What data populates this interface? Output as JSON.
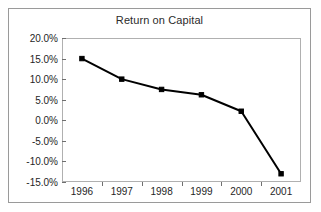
{
  "chart_data": {
    "type": "line",
    "title": "Return on Capital",
    "xlabel": "",
    "ylabel": "",
    "categories": [
      "1996",
      "1997",
      "1998",
      "1999",
      "2000",
      "2001"
    ],
    "values": [
      0.15,
      0.1,
      0.075,
      0.062,
      0.022,
      -0.13
    ],
    "value_labels": [
      "15.0%",
      "10.0%",
      "7.5%",
      "6.2%",
      "2.2%",
      "-13.0%"
    ],
    "ylim": [
      -0.15,
      0.2
    ],
    "y_ticks": [
      0.2,
      0.15,
      0.1,
      0.05,
      0.0,
      -0.05,
      -0.1,
      -0.15
    ],
    "y_tick_labels": [
      "20.0%",
      "15.0%",
      "10.0%",
      "5.0%",
      "0.0%",
      "-5.0%",
      "-10.0%",
      "-15.0%"
    ],
    "grid": false,
    "legend": false,
    "legend_position": "none",
    "series": [
      {
        "name": "Return on Capital",
        "values": [
          0.15,
          0.1,
          0.075,
          0.062,
          0.022,
          -0.13
        ],
        "color": "#000000",
        "marker": "square",
        "line_width": 2
      }
    ],
    "colors": {
      "line": "#000000",
      "marker": "#000000",
      "axis": "#6f6f6f",
      "plot_border": "#b0b0b0",
      "outer_border": "#9a9a9a",
      "text": "#1f1f1f",
      "background": "#ffffff"
    }
  }
}
